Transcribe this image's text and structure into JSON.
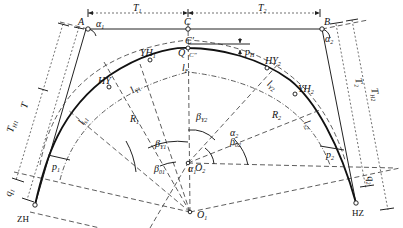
{
  "figure": {
    "points": {
      "A": "A",
      "B": "B",
      "C": "C",
      "C_prime": "C′",
      "C_dprime": "C″",
      "Q": "Q",
      "ZH": "ZH",
      "HZ": "HZ",
      "HY1": "HY",
      "YH1": "YH₁",
      "HY2": "HY₂",
      "YH2": "YH₂",
      "O1": "O₁",
      "O2": "O₂"
    },
    "lengths": {
      "T1": "T₁",
      "T2": "T₂",
      "TH1": "T_H1",
      "TH2": "T_H2",
      "T_left": "T",
      "T_right": "T₂",
      "q1": "q₁",
      "q2": "q₂",
      "p1": "p₁",
      "p2": "p₂",
      "pH": "p_H",
      "lF": "l_F",
      "lY1": "l_Y1",
      "lY2": "l_Y2",
      "ls1": "l_s1",
      "ls2": "l_s2",
      "R1": "R₁",
      "R2": "R₂"
    },
    "angles": {
      "alpha1": "α₁",
      "alpha2": "α₂",
      "beta01": "β₀₁",
      "beta02": "β₀₂",
      "betaY1": "β_Y1",
      "betaY2": "β_Y2",
      "alpha1_center": "α₁",
      "alpha2_center": "α₂"
    }
  }
}
